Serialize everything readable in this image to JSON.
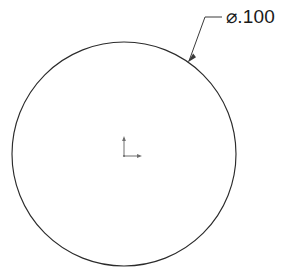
{
  "drawing": {
    "title": "Circle Part View",
    "background_color": "#ffffff",
    "line_color": "#2b2b2b",
    "width": 289,
    "height": 277,
    "geometry": {
      "circle": {
        "name": "outer-circle",
        "center_x": 124,
        "center_y": 154,
        "radius": 112,
        "stroke_color": "#2b2b2b",
        "stroke_width": 1.15
      },
      "origin_marker": {
        "name": "origin-axis-marker",
        "x": 124,
        "y": 156,
        "vertical_length": 18,
        "horizontal_length": 16,
        "stroke_color": "#6e6e6e"
      }
    },
    "dimensions": [
      {
        "id": "dia-1",
        "label": "⌀.100",
        "symbol": "diameter-symbol",
        "value": ".100",
        "text_x": 226,
        "text_y": 18,
        "font_size": 19,
        "color": "#1a1a1a",
        "leader": {
          "arrow_x": 188,
          "arrow_y": 60,
          "elbow_x": 205,
          "elbow_y": 17,
          "shoulder_x": 222,
          "shoulder_y": 17,
          "stroke_color": "#3a3a3a"
        }
      }
    ],
    "watermark": {
      "visible": true,
      "opacity": 0.035,
      "line_1": "",
      "line_2": ""
    }
  }
}
